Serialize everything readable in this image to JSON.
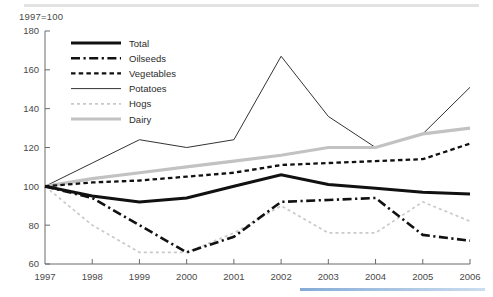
{
  "figure": {
    "index_note": "1997=100",
    "top_rule_color": "#e3e3e3",
    "bottom_rule_color": "#5b8fc9",
    "background": "#ffffff",
    "axis_color": "#6b6b6b"
  },
  "legend": {
    "position": "top-left-inside",
    "entries": [
      {
        "label": "Total",
        "color": "#111111",
        "style": "solid-thick"
      },
      {
        "label": "Oilseeds",
        "color": "#111111",
        "style": "dash-dot-thick"
      },
      {
        "label": "Vegetables",
        "color": "#111111",
        "style": "dashed-medium"
      },
      {
        "label": "Potatoes",
        "color": "#333333",
        "style": "solid-thin"
      },
      {
        "label": "Hogs",
        "color": "#c9c9c9",
        "style": "dotted-light"
      },
      {
        "label": "Dairy",
        "color": "#c2c2c2",
        "style": "solid-thick-light"
      }
    ]
  },
  "chart_data": {
    "type": "line",
    "title": "",
    "subtitle": "",
    "xlabel": "",
    "ylabel": "",
    "annotation": "1997=100",
    "grid": false,
    "legend_position": "top-left-inside",
    "x": [
      1997,
      1998,
      1999,
      2000,
      2001,
      2002,
      2003,
      2004,
      2005,
      2006
    ],
    "categories": [
      "1997",
      "1998",
      "1999",
      "2000",
      "2001",
      "2002",
      "2003",
      "2004",
      "2005",
      "2006"
    ],
    "xlim": [
      1997,
      2006
    ],
    "ylim": [
      60,
      180
    ],
    "ytick_values": [
      60,
      80,
      100,
      120,
      140,
      160,
      180
    ],
    "ytick_labels": [
      "60",
      "80",
      "100",
      "120",
      "140",
      "160",
      "180"
    ],
    "xtick_labels": [
      "1997",
      "1998",
      "1999",
      "2000",
      "2001",
      "2002",
      "2003",
      "2004",
      "2005",
      "2006"
    ],
    "series": [
      {
        "name": "Total",
        "color": "#111111",
        "style": "solid-thick",
        "values": [
          100,
          95,
          92,
          94,
          100,
          106,
          101,
          99,
          97,
          96
        ]
      },
      {
        "name": "Oilseeds",
        "color": "#111111",
        "style": "dash-dot-thick",
        "values": [
          100,
          94,
          80,
          66,
          74,
          92,
          93,
          94,
          75,
          72
        ]
      },
      {
        "name": "Vegetables",
        "color": "#111111",
        "style": "dashed-medium",
        "values": [
          100,
          102,
          103,
          105,
          107,
          111,
          112,
          113,
          114,
          122
        ]
      },
      {
        "name": "Potatoes",
        "color": "#333333",
        "style": "solid-thin",
        "values": [
          100,
          112,
          124,
          120,
          124,
          167,
          136,
          120,
          127,
          151
        ]
      },
      {
        "name": "Hogs",
        "color": "#c9c9c9",
        "style": "dotted-light",
        "values": [
          100,
          80,
          66,
          66,
          76,
          90,
          76,
          76,
          92,
          82
        ]
      },
      {
        "name": "Dairy",
        "color": "#c2c2c2",
        "style": "solid-thick-light",
        "values": [
          100,
          104,
          107,
          110,
          113,
          116,
          120,
          120,
          127,
          130
        ]
      }
    ]
  }
}
